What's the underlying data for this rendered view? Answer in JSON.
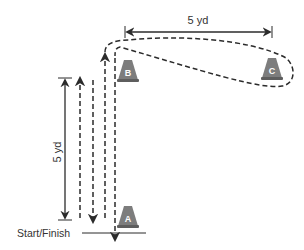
{
  "diagram": {
    "colors": {
      "line": "#2b2b2b",
      "cone_fill": "#7d7d7d",
      "cone_dark": "#5e5e5e",
      "cone_text": "#ffffff",
      "background": "#ffffff"
    },
    "cones": [
      {
        "id": "A",
        "label": "A",
        "x": 128,
        "y": 218
      },
      {
        "id": "B",
        "label": "B",
        "x": 128,
        "y": 72
      },
      {
        "id": "C",
        "label": "C",
        "x": 272,
        "y": 70
      }
    ],
    "measurements": {
      "vertical": {
        "label": "5 yd"
      },
      "horizontal": {
        "label": "5 yd"
      }
    },
    "start_finish_label": "Start/Finish"
  }
}
